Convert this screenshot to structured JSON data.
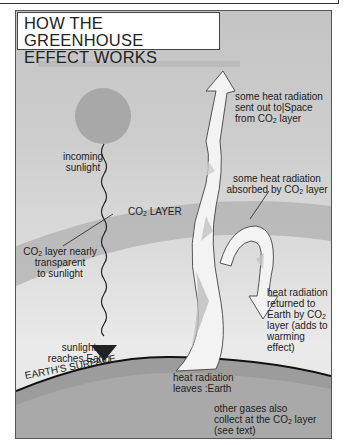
{
  "title": {
    "line1": "HOW THE GREENHOUSE",
    "line2": "EFFECT WORKS"
  },
  "labels": {
    "incoming_sunlight": [
      "incoming",
      "sunlight"
    ],
    "co2_layer": {
      "pre": "CO",
      "sub": "2",
      "post": " LAYER"
    },
    "co2_transparent": {
      "line1_pre": "CO",
      "line1_sub": "2",
      "line1_post": " layer nearly",
      "line2": "transparent",
      "line3": "to sunlight"
    },
    "sunlight_reaches": [
      "sunlight",
      "reaches Earth"
    ],
    "earth_surface": "EARTH'S SURFACE",
    "sent_to_space": {
      "line1": "some heat radiation",
      "line2": "sent out to|Space",
      "line3_pre": "from CO",
      "line3_sub": "2",
      "line3_post": " layer"
    },
    "absorbed": {
      "line1": "some heat radiation",
      "line2_pre": "absorbed by CO",
      "line2_sub": "2",
      "line2_post": " layer"
    },
    "returned": {
      "line1": "heat radiation",
      "line2": "returned to",
      "line3_pre": "Earth by CO",
      "line3_sub": "2",
      "line4": "layer (adds to",
      "line5": "warming",
      "line6": "effect)"
    },
    "leaves_earth": [
      "heat radiation",
      "leaves :Earth"
    ],
    "other_gases": {
      "line1": "other gases also",
      "line2_pre": "collect at the CO",
      "line2_sub": "2",
      "line2_post": " layer",
      "line3": "(see text)"
    }
  },
  "colors": {
    "sky": "#cdcdcd",
    "sun": "#a9a9a9",
    "co2_band": "#b5b5b5",
    "earth": "#a8a8a8",
    "arrow_fill": "#f2f2f2",
    "text": "#222222"
  }
}
